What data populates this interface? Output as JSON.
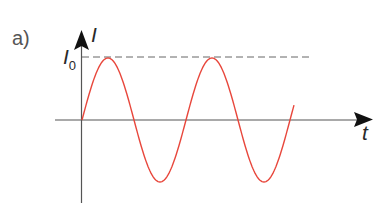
{
  "panel_label": "a)",
  "y_axis": {
    "label": "I"
  },
  "x_axis": {
    "label": "t"
  },
  "amplitude_label": {
    "main": "I",
    "subscript": "0"
  },
  "colors": {
    "curve": "#e8473c",
    "axes": "#555555",
    "dashed": "#666666",
    "arrow": "#111111"
  },
  "geometry": {
    "origin": [
      82,
      120
    ],
    "period_px": 104,
    "amplitude_px": 62,
    "curve_end_x": 294,
    "x_axis_start": 55,
    "x_axis_end": 372,
    "y_axis_top": 31,
    "y_axis_bottom": 203,
    "dashed_y": 57,
    "dashed_end_x": 313
  },
  "curve": {
    "type": "sine",
    "description": "I(t) = I0 sin(wt), approximately two periods shown"
  }
}
